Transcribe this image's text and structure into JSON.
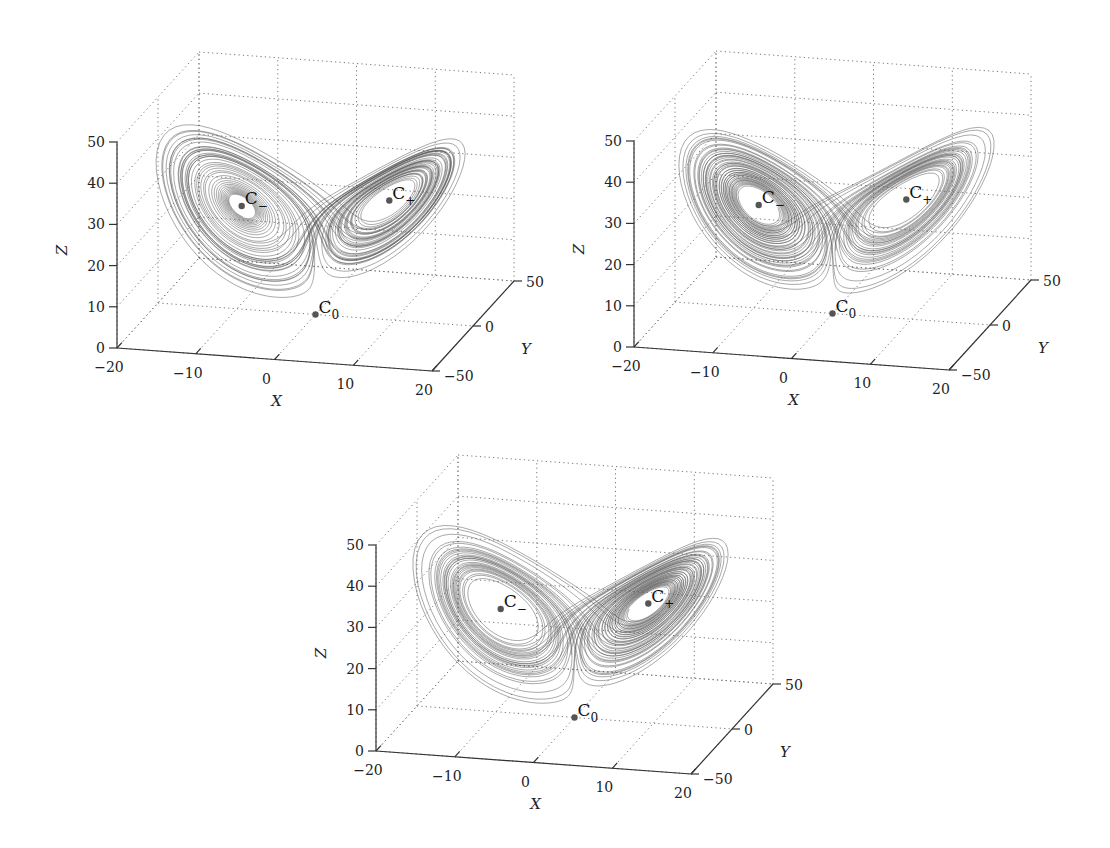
{
  "chart_data": [
    {
      "type": "line",
      "subtype": "3d-trajectory",
      "title": "",
      "description": "Lorenz attractor trajectory with equilibria C−, C0, C+ (trajectory densest around C−, C+ appears with hole)",
      "xlabel": "X",
      "ylabel": "Y",
      "zlabel": "Z",
      "xlim": [
        -20,
        20
      ],
      "ylim": [
        -50,
        50
      ],
      "zlim": [
        0,
        50
      ],
      "xticks": [
        -20,
        -10,
        0,
        10,
        20
      ],
      "yticks": [
        -50,
        0,
        50
      ],
      "zticks": [
        0,
        10,
        20,
        30,
        40,
        50
      ],
      "grid": true,
      "params": {
        "sigma": 10,
        "rho": 28,
        "beta": 2.6667
      },
      "equilibria": [
        {
          "name": "C−",
          "label": "C",
          "sub": "−",
          "x": -8.485,
          "y": -8.485,
          "z": 27
        },
        {
          "name": "C+",
          "label": "C",
          "sub": "+",
          "x": 8.485,
          "y": 8.485,
          "z": 27
        },
        {
          "name": "C0",
          "label": "C",
          "sub": "0",
          "x": 0,
          "y": 0,
          "z": 0
        }
      ],
      "ylabel_italic": false,
      "origin_px": [
        117,
        348
      ],
      "seed": [
        1,
        1,
        1
      ]
    },
    {
      "type": "line",
      "subtype": "3d-trajectory",
      "title": "",
      "description": "Lorenz attractor trajectory; hole around C−, dense region around C+",
      "xlabel": "X",
      "ylabel": "Y",
      "zlabel": "Z",
      "xlim": [
        -20,
        20
      ],
      "ylim": [
        -50,
        50
      ],
      "zlim": [
        0,
        50
      ],
      "xticks": [
        -20,
        -10,
        0,
        10,
        20
      ],
      "yticks": [
        -50,
        0,
        50
      ],
      "zticks": [
        0,
        10,
        20,
        30,
        40,
        50
      ],
      "grid": true,
      "params": {
        "sigma": 10,
        "rho": 28,
        "beta": 2.6667
      },
      "equilibria": [
        {
          "name": "C−",
          "label": "C",
          "sub": "−",
          "x": -8.485,
          "y": -8.485,
          "z": 27
        },
        {
          "name": "C+",
          "label": "C",
          "sub": "+",
          "x": 8.485,
          "y": 8.485,
          "z": 27
        },
        {
          "name": "C0",
          "label": "C",
          "sub": "0",
          "x": 0,
          "y": 0,
          "z": 0
        }
      ],
      "ylabel_italic": true,
      "origin_px": [
        634,
        347
      ],
      "seed": [
        -8.0,
        -7.0,
        30.0
      ]
    },
    {
      "type": "line",
      "subtype": "3d-trajectory",
      "title": "",
      "description": "Lorenz attractor trajectory; dense region around C−, hole around C+",
      "xlabel": "X",
      "ylabel": "Y",
      "zlabel": "Z",
      "xlim": [
        -20,
        20
      ],
      "ylim": [
        -50,
        50
      ],
      "zlim": [
        0,
        50
      ],
      "xticks": [
        -20,
        -10,
        0,
        10,
        20
      ],
      "yticks": [
        -50,
        0,
        50
      ],
      "zticks": [
        0,
        10,
        20,
        30,
        40,
        50
      ],
      "grid": true,
      "params": {
        "sigma": 10,
        "rho": 28,
        "beta": 2.6667
      },
      "equilibria": [
        {
          "name": "C−",
          "label": "C",
          "sub": "−",
          "x": -8.485,
          "y": -8.485,
          "z": 27
        },
        {
          "name": "C+",
          "label": "C",
          "sub": "+",
          "x": 8.485,
          "y": 8.485,
          "z": 27
        },
        {
          "name": "C0",
          "label": "C",
          "sub": "0",
          "x": 0,
          "y": 0,
          "z": 0
        }
      ],
      "ylabel_italic": true,
      "origin_px": [
        376,
        751
      ],
      "seed": [
        8.0,
        7.0,
        30.0
      ]
    }
  ],
  "style": {
    "trajectory_color": "#555555",
    "point_color": "#555555",
    "axis_color": "#333333",
    "grid_color": "#777777"
  }
}
